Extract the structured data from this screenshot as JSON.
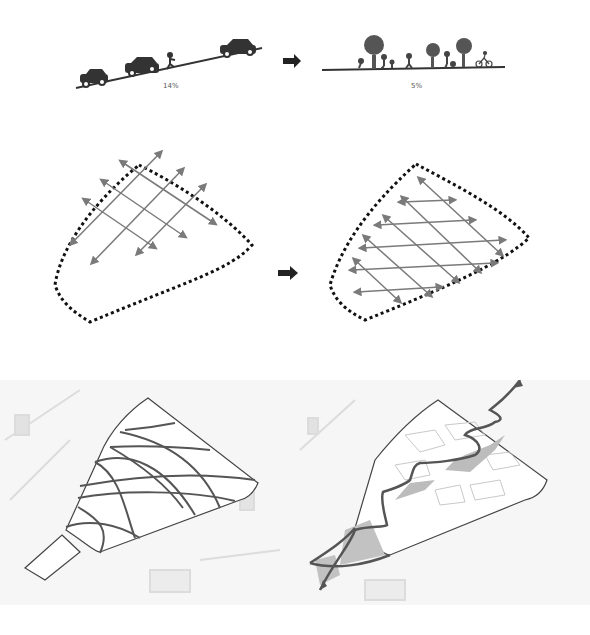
{
  "row1": {
    "left": {
      "label": "14%",
      "description": "cars on steep slope"
    },
    "right": {
      "label": "5%",
      "description": "pedestrians, trees, cyclist on gentle slope"
    },
    "arrow": "right-arrow"
  },
  "row2": {
    "left": {
      "description": "diagonal crossing arrow grid in dashed boundary"
    },
    "right": {
      "description": "reoriented arrow grid in dashed boundary"
    },
    "arrow": "right-arrow"
  },
  "row3": {
    "left": {
      "description": "site plan with curved movement lines"
    },
    "right": {
      "description": "site plan with zigzag path and shaded spaces"
    }
  },
  "colors": {
    "ink": "#333333",
    "arrow_grey": "#7a7a7a",
    "shade": "#b9b9b9",
    "map_grey": "#d8d8d8"
  }
}
